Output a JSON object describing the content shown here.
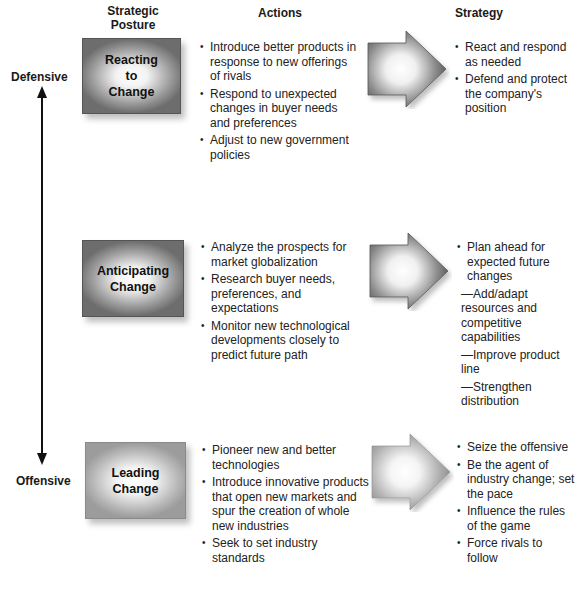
{
  "headers": {
    "posture": "Strategic Posture",
    "actions": "Actions",
    "strategy": "Strategy"
  },
  "axis": {
    "top_label": "Defensive",
    "bottom_label": "Offensive"
  },
  "rows": [
    {
      "posture": "Reacting to Change",
      "posture_lines": [
        "Reacting",
        "to",
        "Change"
      ],
      "actions": [
        "Introduce better products in response to new offerings of rivals",
        "Respond to unexpected changes in buyer needs and preferences",
        "Adjust to new government policies"
      ],
      "strategy": [
        "React and respond as needed",
        "Defend and protect the company's position"
      ]
    },
    {
      "posture": "Anticipating Change",
      "posture_lines": [
        "Anticipating",
        "Change"
      ],
      "actions": [
        "Analyze the prospects for market globalization",
        "Research buyer needs, preferences, and expectations",
        "Monitor new technological developments closely to predict future path"
      ],
      "strategy": [
        "Plan ahead for expected future changes",
        "—Add/adapt resources and competitive capabilities",
        "—Improve product line",
        "—Strengthen distribution"
      ]
    },
    {
      "posture": "Leading Change",
      "posture_lines": [
        "Leading",
        "Change"
      ],
      "actions": [
        "Pioneer new and better technologies",
        "Introduce innovative products that open new markets and spur the creation of whole new industries",
        "Seek to set industry standards"
      ],
      "strategy": [
        "Seize the offensive",
        "Be the agent of industry change; set the pace",
        "Influence the rules of the game",
        "Force rivals to follow"
      ]
    }
  ]
}
